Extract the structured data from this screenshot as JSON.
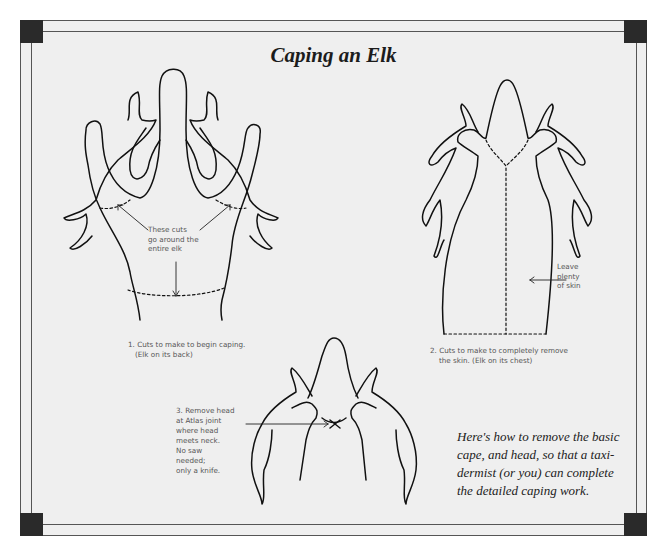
{
  "title": "Caping an Elk",
  "figures": [
    {
      "id": 1,
      "view": "Elk on its back",
      "caption_line1": "1. Cuts to make to begin caping.",
      "caption_line2": "(Elk on its back)",
      "callout": "These cuts\ngo around the\nentire elk"
    },
    {
      "id": 2,
      "view": "Elk on its chest",
      "caption_line1": "2. Cuts to make to completely remove",
      "caption_line2": "the skin. (Elk on its chest)",
      "callout": "Leave\nplenty\nof skin"
    },
    {
      "id": 3,
      "caption": "3. Remove head\nat Atlas joint\nwhere head\nmeets neck.\nNo saw\nneeded;\nonly a knife."
    }
  ],
  "note": "Here's how to remove the basic\ncape, and head, so that a taxi-\ndermist (or you) can complete\nthe detailed caping work.",
  "colors": {
    "background": "#efefef",
    "frame": "#555555",
    "corner": "#2a2a2a",
    "line_art": "#111111"
  }
}
